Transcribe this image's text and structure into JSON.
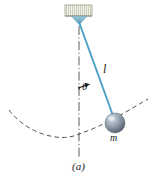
{
  "figure": {
    "caption": "(a)",
    "background_color": "#ffffff"
  },
  "labels": {
    "length": "l",
    "angle": "θ",
    "mass": "m"
  },
  "colors": {
    "string": "#4a9fc4",
    "bob_light": "#c3ccd6",
    "bob_mid": "#8e9aa6",
    "bob_dark": "#5b6672",
    "ceiling_fill": "#eef0e2",
    "ceiling_edge": "#9aa08a",
    "pivot": "#7ab4cc",
    "dash_line": "#3a3a3a",
    "center_line": "#4a4a4a",
    "text": "#1a1a1a"
  },
  "geometry": {
    "pivot_x": 79,
    "pivot_y": 22,
    "bob_x": 115,
    "bob_y": 123,
    "bob_radius": 10,
    "string_length_px": 107,
    "angle_degrees": 20,
    "center_line_bottom_y": 158,
    "arc_radius_px": 101
  },
  "elements": {
    "ceiling_name": "ceiling-support",
    "pivot_name": "pivot-triangle",
    "string_name": "pendulum-string",
    "bob_name": "pendulum-bob",
    "arc_name": "swing-path-arc",
    "centerline_name": "vertical-center-line",
    "angle_arc_name": "angle-indicator-arc"
  }
}
